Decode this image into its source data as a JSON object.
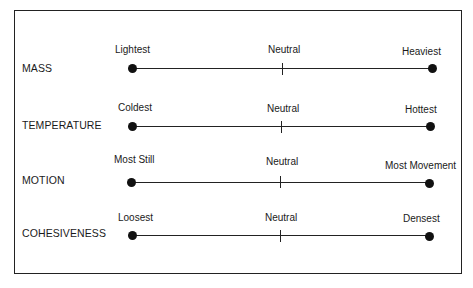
{
  "scales": [
    {
      "name": "MASS",
      "left": "Lightest",
      "middle": "Neutral",
      "right": "Heaviest"
    },
    {
      "name": "TEMPERATURE",
      "left": "Coldest",
      "middle": "Neutral",
      "right": "Hottest"
    },
    {
      "name": "MOTION",
      "left": "Most Still",
      "middle": "Neutral",
      "right": "Most Movement"
    },
    {
      "name": "COHESIVENESS",
      "left": "Loosest",
      "middle": "Neutral",
      "right": "Densest"
    }
  ]
}
